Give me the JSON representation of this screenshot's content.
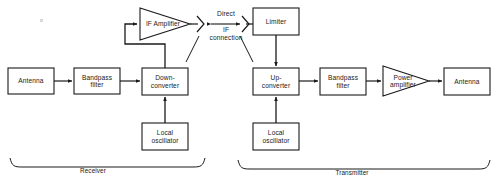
{
  "diagram": {
    "background_color": "#ffffff",
    "line_color": "#1a1a1a",
    "text_color": "#1a1a1a",
    "blocks": [
      {
        "id": "rx-antenna",
        "name": "antenna-receive-block",
        "label": "Antenna",
        "shape": "rect",
        "x": 8,
        "y": 68,
        "w": 46,
        "h": 26
      },
      {
        "id": "rx-bandpass",
        "name": "bandpass-filter-rx-block",
        "label": "Bandpass\nfilter",
        "shape": "rect",
        "x": 74,
        "y": 68,
        "w": 46,
        "h": 26
      },
      {
        "id": "down-converter",
        "name": "down-converter-block",
        "label": "Down-\nconverter",
        "shape": "rect",
        "x": 142,
        "y": 68,
        "w": 46,
        "h": 27
      },
      {
        "id": "if-amplifier",
        "name": "if-amplifier-block",
        "label": "IF Amplifier",
        "shape": "triangle",
        "x": 140,
        "y": 8,
        "w": 50,
        "h": 32
      },
      {
        "id": "rx-local-osc",
        "name": "local-oscillator-rx-block",
        "label": "Local\noscillator",
        "shape": "rect",
        "x": 142,
        "y": 123,
        "w": 46,
        "h": 27
      },
      {
        "id": "limiter",
        "name": "limiter-block",
        "label": "Limiter",
        "shape": "rect",
        "x": 253,
        "y": 8,
        "w": 46,
        "h": 27
      },
      {
        "id": "up-converter",
        "name": "up-converter-block",
        "label": "Up-\nconverter",
        "shape": "rect",
        "x": 253,
        "y": 68,
        "w": 46,
        "h": 27
      },
      {
        "id": "tx-local-osc",
        "name": "local-oscillator-tx-block",
        "label": "Local\noscillator",
        "shape": "rect",
        "x": 253,
        "y": 123,
        "w": 46,
        "h": 27
      },
      {
        "id": "tx-bandpass",
        "name": "bandpass-filter-tx-block",
        "label": "Bandpass\nfilter",
        "shape": "rect",
        "x": 320,
        "y": 68,
        "w": 46,
        "h": 27
      },
      {
        "id": "power-amplifier",
        "name": "power-amplifier-block",
        "label": "Power\namplifier",
        "shape": "triangle",
        "x": 383,
        "y": 66,
        "w": 46,
        "h": 30
      },
      {
        "id": "tx-antenna",
        "name": "antenna-transmit-block",
        "label": "Antenna",
        "shape": "rect",
        "x": 444,
        "y": 68,
        "w": 46,
        "h": 27
      }
    ],
    "annotations": [
      {
        "id": "direct-if",
        "name": "direct-if-connection-label",
        "line1": "Direct",
        "line2": "IF",
        "line3": "connection",
        "x": 200,
        "y": 8,
        "w": 56
      }
    ],
    "group_braces": [
      {
        "id": "receiver-brace",
        "name": "receiver-group-label",
        "label": "Receiver",
        "x1": 10,
        "x2": 205,
        "y": 166,
        "label_x": 93,
        "label_y": 169
      },
      {
        "id": "transmitter-brace",
        "name": "transmitter-group-label",
        "label": "Transmitter",
        "x1": 238,
        "x2": 490,
        "y": 168,
        "label_x": 352,
        "label_y": 171
      }
    ],
    "connections": [
      {
        "name": "antenna-to-bandpass-rx",
        "from": "rx-antenna",
        "to": "rx-bandpass",
        "direction": "right"
      },
      {
        "name": "bandpass-rx-to-down-converter",
        "from": "rx-bandpass",
        "to": "down-converter",
        "direction": "right"
      },
      {
        "name": "down-converter-to-if-amplifier",
        "from": "down-converter",
        "to": "if-amplifier",
        "direction": "up-left-right"
      },
      {
        "name": "local-osc-to-down-converter",
        "from": "rx-local-osc",
        "to": "down-converter",
        "direction": "up"
      },
      {
        "name": "if-amplifier-to-limiter",
        "from": "if-amplifier",
        "to": "limiter",
        "direction": "right-via-connector"
      },
      {
        "name": "limiter-to-up-converter",
        "from": "limiter",
        "to": "up-converter",
        "direction": "down"
      },
      {
        "name": "local-osc-to-up-converter",
        "from": "tx-local-osc",
        "to": "up-converter",
        "direction": "up"
      },
      {
        "name": "up-converter-to-bandpass-tx",
        "from": "up-converter",
        "to": "tx-bandpass",
        "direction": "right"
      },
      {
        "name": "bandpass-tx-to-power-amplifier",
        "from": "tx-bandpass",
        "to": "power-amplifier",
        "direction": "right"
      },
      {
        "name": "power-amplifier-to-antenna",
        "from": "power-amplifier",
        "to": "tx-antenna",
        "direction": "right"
      }
    ]
  }
}
